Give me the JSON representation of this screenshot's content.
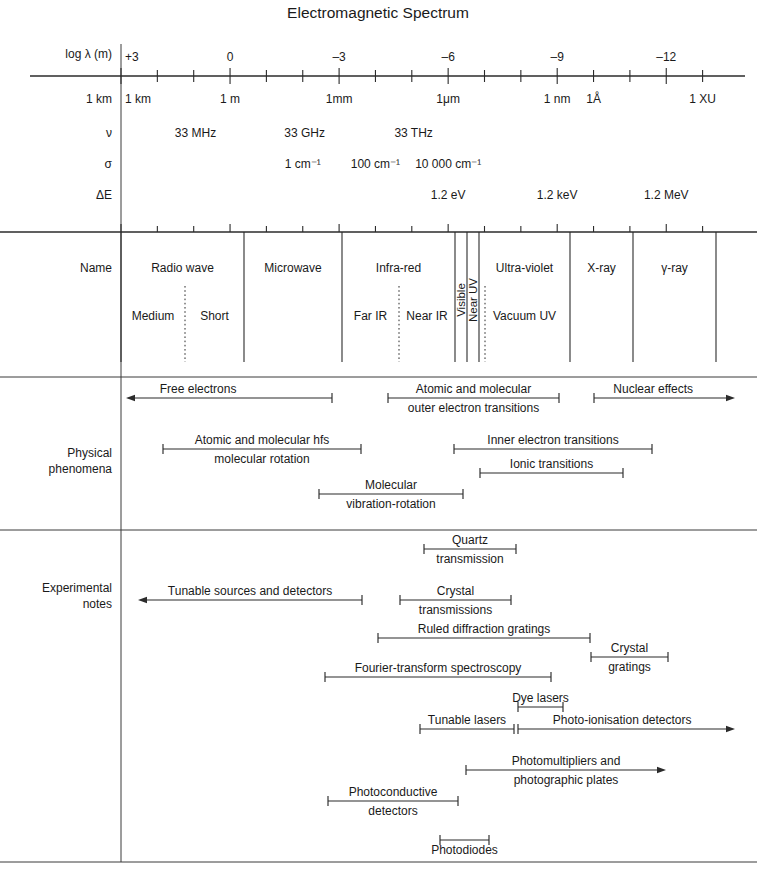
{
  "title": "Electromagnetic Spectrum",
  "axis": {
    "x_start_px": 121,
    "x_end_px": 716,
    "px_per_decade": 36.35,
    "log_at_start": 3,
    "row_labels": {
      "loglambda": "log λ (m)",
      "wavelength": "1 km",
      "nu": "ν",
      "sigma": "σ",
      "deltaE": "ΔE"
    },
    "tick_labels": [
      {
        "log": 3,
        "text": "+3"
      },
      {
        "log": 0,
        "text": "0"
      },
      {
        "log": -3,
        "text": "–3"
      },
      {
        "log": -6,
        "text": "–6"
      },
      {
        "log": -9,
        "text": "–9"
      },
      {
        "log": -12,
        "text": "–12"
      }
    ],
    "wavelength_marks": [
      {
        "log": 3,
        "text": "1 km",
        "anchor": "start"
      },
      {
        "log": 0,
        "text": "1 m",
        "anchor": "middle"
      },
      {
        "log": -3,
        "text": "1mm",
        "anchor": "middle"
      },
      {
        "log": -6,
        "text": "1μm",
        "anchor": "middle"
      },
      {
        "log": -9,
        "text": "1 nm",
        "anchor": "middle"
      },
      {
        "log": -10,
        "text": "1Å",
        "anchor": "middle"
      },
      {
        "log": -13,
        "text": "1 XU",
        "anchor": "middle"
      }
    ],
    "frequency_marks": [
      {
        "log": 0.95,
        "text": "33 MHz"
      },
      {
        "log": -2.05,
        "text": "33 GHz"
      },
      {
        "log": -5.05,
        "text": "33 THz"
      }
    ],
    "wavenumber_marks": [
      {
        "log": -2.0,
        "text": "1 cm⁻¹"
      },
      {
        "log": -4.0,
        "text": "100 cm⁻¹"
      },
      {
        "log": -6.0,
        "text": "10 000 cm⁻¹"
      }
    ],
    "energy_marks": [
      {
        "log": -6.0,
        "text": "1.2 eV"
      },
      {
        "log": -9.0,
        "text": "1.2 keV"
      },
      {
        "log": -12.0,
        "text": "1.2 MeV"
      }
    ]
  },
  "name_band": {
    "label": "Name",
    "primary": [
      {
        "name": "Radio wave",
        "x0": 121,
        "x1": 244
      },
      {
        "name": "Microwave",
        "x0": 244,
        "x1": 342
      },
      {
        "name": "Infra-red",
        "x0": 342,
        "x1": 455
      },
      {
        "name": "Visible",
        "x0": 455,
        "x1": 467,
        "vertical": true
      },
      {
        "name": "Near UV",
        "x0": 467,
        "x1": 479,
        "vertical": true
      },
      {
        "name": "Ultra-violet",
        "x0": 479,
        "x1": 570
      },
      {
        "name": "X-ray",
        "x0": 570,
        "x1": 633
      },
      {
        "name": "γ-ray",
        "x0": 633,
        "x1": 716
      }
    ],
    "secondary": [
      {
        "name": "Medium",
        "x0": 121,
        "x1": 185
      },
      {
        "name": "Short",
        "x0": 185,
        "x1": 244
      },
      {
        "name": "Far IR",
        "x0": 342,
        "x1": 399
      },
      {
        "name": "Near IR",
        "x0": 399,
        "x1": 455
      },
      {
        "name": "Vacuum UV",
        "x0": 479,
        "x1": 570
      }
    ],
    "dotted_dividers": [
      185,
      399,
      485
    ]
  },
  "physical_phenomena": {
    "label_line1": "Physical",
    "label_line2": "phenomena",
    "spans": [
      {
        "id": "free-electrons",
        "lines": [
          "Free electrons"
        ],
        "x0": 126,
        "x1": 332,
        "y": 398,
        "left_arrow": true,
        "right_arrow": false,
        "label_anchor": 0.35,
        "label_above": true
      },
      {
        "id": "atomic-molecular-outer",
        "lines": [
          "Atomic and molecular",
          "outer electron transitions"
        ],
        "x0": 388,
        "x1": 559,
        "y": 398,
        "left_arrow": false,
        "right_arrow": false,
        "label_anchor": 0.5,
        "label_above": true
      },
      {
        "id": "nuclear-effects",
        "lines": [
          "Nuclear effects"
        ],
        "x0": 594,
        "x1": 735,
        "y": 398,
        "left_arrow": false,
        "right_arrow": true,
        "label_anchor": 0.42,
        "label_above": true
      },
      {
        "id": "atomic-molecular-hfs",
        "lines": [
          "Atomic and molecular hfs",
          "molecular rotation"
        ],
        "x0": 163,
        "x1": 361,
        "y": 449,
        "left_arrow": false,
        "right_arrow": false,
        "label_anchor": 0.5,
        "label_above": true
      },
      {
        "id": "inner-electron-transitions",
        "lines": [
          "Inner electron transitions"
        ],
        "x0": 454,
        "x1": 652,
        "y": 449,
        "left_arrow": false,
        "right_arrow": false,
        "label_anchor": 0.5,
        "label_above": true
      },
      {
        "id": "ionic-transitions",
        "lines": [
          "Ionic transitions"
        ],
        "x0": 480,
        "x1": 623,
        "y": 473,
        "left_arrow": false,
        "right_arrow": false,
        "label_anchor": 0.5,
        "label_above": true
      },
      {
        "id": "molecular-vibration-rotation",
        "lines": [
          "Molecular",
          "vibration-rotation"
        ],
        "x0": 319,
        "x1": 463,
        "y": 494,
        "left_arrow": false,
        "right_arrow": false,
        "label_anchor": 0.5,
        "label_above": true
      }
    ]
  },
  "experimental_notes": {
    "label_line1": "Experimental",
    "label_line2": "notes",
    "spans": [
      {
        "id": "quartz-transmission",
        "lines": [
          "Quartz",
          "transmission"
        ],
        "x0": 424,
        "x1": 516,
        "y": 549,
        "left_arrow": false,
        "right_arrow": false,
        "label_anchor": 0.5,
        "label_above": true,
        "sub_below": true
      },
      {
        "id": "tunable-sources-detectors",
        "lines": [
          "Tunable sources and detectors"
        ],
        "x0": 138,
        "x1": 362,
        "y": 600,
        "left_arrow": true,
        "right_arrow": false,
        "label_anchor": 0.5,
        "label_above": true
      },
      {
        "id": "crystal-transmissions",
        "lines": [
          "Crystal",
          "transmissions"
        ],
        "x0": 400,
        "x1": 511,
        "y": 600,
        "left_arrow": false,
        "right_arrow": false,
        "label_anchor": 0.5,
        "label_above": true,
        "sub_below": true
      },
      {
        "id": "ruled-diffraction-gratings",
        "lines": [
          "Ruled diffraction gratings"
        ],
        "x0": 378,
        "x1": 590,
        "y": 638,
        "left_arrow": false,
        "right_arrow": false,
        "label_anchor": 0.5,
        "label_above": true
      },
      {
        "id": "crystal-gratings",
        "lines": [
          "Crystal",
          "gratings"
        ],
        "x0": 591,
        "x1": 668,
        "y": 657,
        "left_arrow": false,
        "right_arrow": false,
        "label_anchor": 0.5,
        "label_above": true,
        "sub_below": true
      },
      {
        "id": "fourier-transform-spectroscopy",
        "lines": [
          "Fourier-transform spectroscopy"
        ],
        "x0": 325,
        "x1": 551,
        "y": 677,
        "left_arrow": false,
        "right_arrow": false,
        "label_anchor": 0.5,
        "label_above": true
      },
      {
        "id": "dye-lasers",
        "lines": [
          "Dye lasers"
        ],
        "x0": 518,
        "x1": 563,
        "y": 707,
        "left_arrow": false,
        "right_arrow": false,
        "label_anchor": 0.5,
        "label_above": true
      },
      {
        "id": "tunable-lasers",
        "lines": [
          "Tunable lasers"
        ],
        "x0": 420,
        "x1": 514,
        "y": 729,
        "left_arrow": false,
        "right_arrow": false,
        "label_anchor": 0.5,
        "label_above": true
      },
      {
        "id": "photo-ionisation-detectors",
        "lines": [
          "Photo-ionisation detectors"
        ],
        "x0": 518,
        "x1": 735,
        "y": 729,
        "left_arrow": false,
        "right_arrow": true,
        "label_anchor": 0.48,
        "label_above": true
      },
      {
        "id": "photomultipliers",
        "lines": [
          "Photomultipliers and",
          "photographic plates"
        ],
        "x0": 466,
        "x1": 666,
        "y": 770,
        "left_arrow": false,
        "right_arrow": true,
        "label_anchor": 0.5,
        "label_above": true,
        "sub_below": true
      },
      {
        "id": "photoconductive-detectors",
        "lines": [
          "Photoconductive",
          "detectors"
        ],
        "x0": 328,
        "x1": 458,
        "y": 801,
        "left_arrow": false,
        "right_arrow": false,
        "label_anchor": 0.5,
        "label_above": true,
        "sub_below": true
      },
      {
        "id": "photodiodes",
        "lines": [
          "Photodiodes"
        ],
        "x0": 440,
        "x1": 489,
        "y": 840,
        "left_arrow": false,
        "right_arrow": false,
        "label_anchor": 0.5,
        "label_above": false
      }
    ]
  },
  "geometry": {
    "divider_x": 121,
    "axis1_y": 76,
    "axis2_y": 232,
    "rule_phys_y": 377,
    "rule_exp_y": 530,
    "bottom_rule_y": 862,
    "band_bottom_y": 362,
    "row_y": {
      "loglambda_label": 58,
      "ticklabels": 61,
      "wavelength": 103,
      "nu": 137,
      "sigma": 168,
      "deltaE": 199
    }
  }
}
